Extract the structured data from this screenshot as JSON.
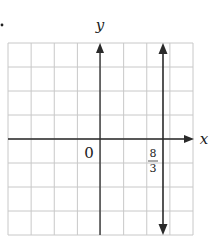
{
  "problem_marker": ".",
  "chart_data": {
    "type": "line",
    "title": "",
    "xlabel": "x",
    "ylabel": "y",
    "origin_label": "0",
    "xlim": [
      -4,
      4
    ],
    "ylim": [
      -4,
      4
    ],
    "grid": true,
    "grid_step": 1,
    "series": [
      {
        "name": "x = 8/3",
        "kind": "vertical-line",
        "x": 2.6667,
        "x_label_numerator": "8",
        "x_label_denominator": "3",
        "arrows": "both"
      }
    ],
    "colors": {
      "grid": "#c8c8c8",
      "axes": "#2a2a2a",
      "line": "#2a2a2a",
      "text": "#1a1a1a"
    }
  },
  "labels": {
    "x_axis": "x",
    "y_axis": "y",
    "origin": "0",
    "tick_numerator": "8",
    "tick_denominator": "3"
  }
}
